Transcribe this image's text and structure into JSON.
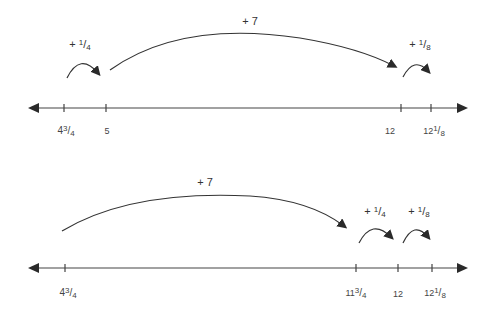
{
  "diagrams": [
    {
      "name": "number-line-1",
      "ticks": [
        {
          "whole": "4",
          "num": "3",
          "den": "4"
        },
        {
          "whole": "5",
          "num": "",
          "den": ""
        },
        {
          "whole": "12",
          "num": "",
          "den": ""
        },
        {
          "whole": "12",
          "num": "1",
          "den": "8"
        }
      ],
      "jumps": [
        {
          "sign": "+ ",
          "whole": "",
          "num": "1",
          "den": "4"
        },
        {
          "sign": "+ 7",
          "whole": "",
          "num": "",
          "den": ""
        },
        {
          "sign": "+ ",
          "whole": "",
          "num": "1",
          "den": "8"
        }
      ]
    },
    {
      "name": "number-line-2",
      "ticks": [
        {
          "whole": "4",
          "num": "3",
          "den": "4"
        },
        {
          "whole": "11",
          "num": "3",
          "den": "4"
        },
        {
          "whole": "12",
          "num": "",
          "den": ""
        },
        {
          "whole": "12",
          "num": "1",
          "den": "8"
        }
      ],
      "jumps": [
        {
          "sign": "+ 7",
          "whole": "",
          "num": "",
          "den": ""
        },
        {
          "sign": "+ ",
          "whole": "",
          "num": "1",
          "den": "4"
        },
        {
          "sign": "+ ",
          "whole": "",
          "num": "1",
          "den": "8"
        }
      ]
    }
  ],
  "colors": {
    "line": "#3a3a3a",
    "text": "#444444"
  }
}
